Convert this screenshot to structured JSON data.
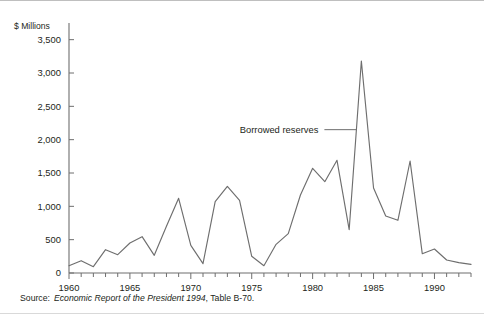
{
  "figure": {
    "y_axis_title": "$ Millions",
    "source_label": "Source:",
    "source_italic": "Economic Report of the President 1994",
    "source_tail": ", Table B-70."
  },
  "annotation": {
    "label": "Borrowed reserves"
  },
  "chart_data": {
    "type": "line",
    "title": "",
    "xlabel": "",
    "ylabel": "$ Millions",
    "ylim": [
      0,
      3750
    ],
    "xlim": [
      1960,
      1993
    ],
    "grid": false,
    "legend": "none",
    "y_ticks": [
      0,
      500,
      1000,
      1500,
      2000,
      2500,
      3000,
      3500
    ],
    "y_tick_labels": [
      "0",
      "500",
      "1,000",
      "1,500",
      "2,000",
      "2,500",
      "3,000",
      "3,500"
    ],
    "x_ticks": [
      1960,
      1961,
      1962,
      1963,
      1964,
      1965,
      1966,
      1967,
      1968,
      1969,
      1970,
      1971,
      1972,
      1973,
      1974,
      1975,
      1976,
      1977,
      1978,
      1979,
      1980,
      1981,
      1982,
      1983,
      1984,
      1985,
      1986,
      1987,
      1988,
      1989,
      1990,
      1991,
      1992,
      1993
    ],
    "x_tick_labels": [
      "1960",
      "1965",
      "1970",
      "1975",
      "1980",
      "1985",
      "1990"
    ],
    "x_major_ticks": [
      1960,
      1965,
      1970,
      1975,
      1980,
      1985,
      1990
    ],
    "series": [
      {
        "name": "Borrowed reserves",
        "color": "#6e6e6e",
        "x": [
          1960,
          1961,
          1962,
          1963,
          1964,
          1965,
          1966,
          1967,
          1968,
          1969,
          1970,
          1971,
          1972,
          1973,
          1974,
          1975,
          1976,
          1977,
          1978,
          1979,
          1980,
          1981,
          1982,
          1983,
          1984,
          1985,
          1986,
          1987,
          1988,
          1989,
          1990,
          1991,
          1992,
          1993
        ],
        "values": [
          110,
          185,
          95,
          350,
          275,
          450,
          545,
          265,
          700,
          1120,
          415,
          140,
          1070,
          1300,
          1090,
          250,
          110,
          430,
          590,
          1170,
          1570,
          1370,
          1690,
          650,
          3180,
          1275,
          855,
          790,
          1680,
          290,
          360,
          195,
          155,
          130
        ]
      }
    ],
    "annotations": [
      {
        "text": "Borrowed reserves",
        "points_to_x": 1984,
        "points_to_y": 2150
      }
    ]
  }
}
